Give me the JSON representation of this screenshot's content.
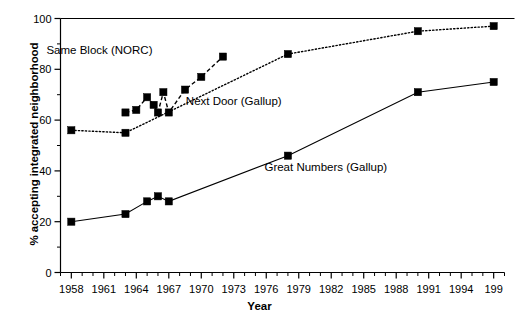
{
  "chart_data": {
    "type": "line",
    "title": "",
    "xlabel": "Year",
    "ylabel": "% accepting integrated neighborhood",
    "xlim": [
      1957,
      1998
    ],
    "ylim": [
      0,
      100
    ],
    "grid": false,
    "legend_position": "inline-annotations",
    "y_ticks": [
      "0",
      "20",
      "40",
      "60",
      "80",
      "100"
    ],
    "y_tick_values": [
      0,
      20,
      40,
      60,
      80,
      100
    ],
    "y_minor_interval": 10,
    "x_ticks": [
      "1958",
      "1961",
      "1964",
      "1967",
      "1970",
      "1973",
      "1976",
      "1979",
      "1982",
      "1985",
      "1988",
      "1991",
      "1994",
      "199"
    ],
    "x_tick_values": [
      1958,
      1961,
      1964,
      1967,
      1970,
      1973,
      1976,
      1979,
      1982,
      1985,
      1988,
      1991,
      1994,
      1997
    ],
    "x_minor_interval": 1,
    "series": [
      {
        "name": "Same Block (NORC)",
        "style": "dashed",
        "color": "#000000",
        "marker": "square",
        "annotation": "Same Block (NORC)",
        "x": [
          1963,
          1964,
          1965,
          1965.6,
          1966,
          1966.5,
          1967,
          1968.5,
          1970,
          1972
        ],
        "values": [
          63,
          64,
          69,
          66,
          63,
          71,
          63,
          72,
          77,
          85
        ]
      },
      {
        "name": "Next Door (Gallup)",
        "style": "dotted",
        "color": "#000000",
        "marker": "square",
        "annotation": "Next Door (Gallup)",
        "x": [
          1958,
          1963,
          1978,
          1990,
          1997
        ],
        "values": [
          56,
          55,
          86,
          95,
          97
        ]
      },
      {
        "name": "Great Numbers (Gallup)",
        "style": "solid",
        "color": "#000000",
        "marker": "square",
        "annotation": "Great Numbers (Gallup)",
        "x": [
          1958,
          1963,
          1965,
          1966,
          1967,
          1978,
          1990,
          1997
        ],
        "values": [
          20,
          23,
          28,
          30,
          28,
          46,
          71,
          75
        ]
      }
    ],
    "annotations": [
      {
        "text": "Same Block (NORC)",
        "x": 1960.6,
        "y": 86
      },
      {
        "text": "Next Door (Gallup)",
        "x": 1973.0,
        "y": 66
      },
      {
        "text": "Great Numbers (Gallup)",
        "x": 1981.5,
        "y": 40
      }
    ]
  }
}
